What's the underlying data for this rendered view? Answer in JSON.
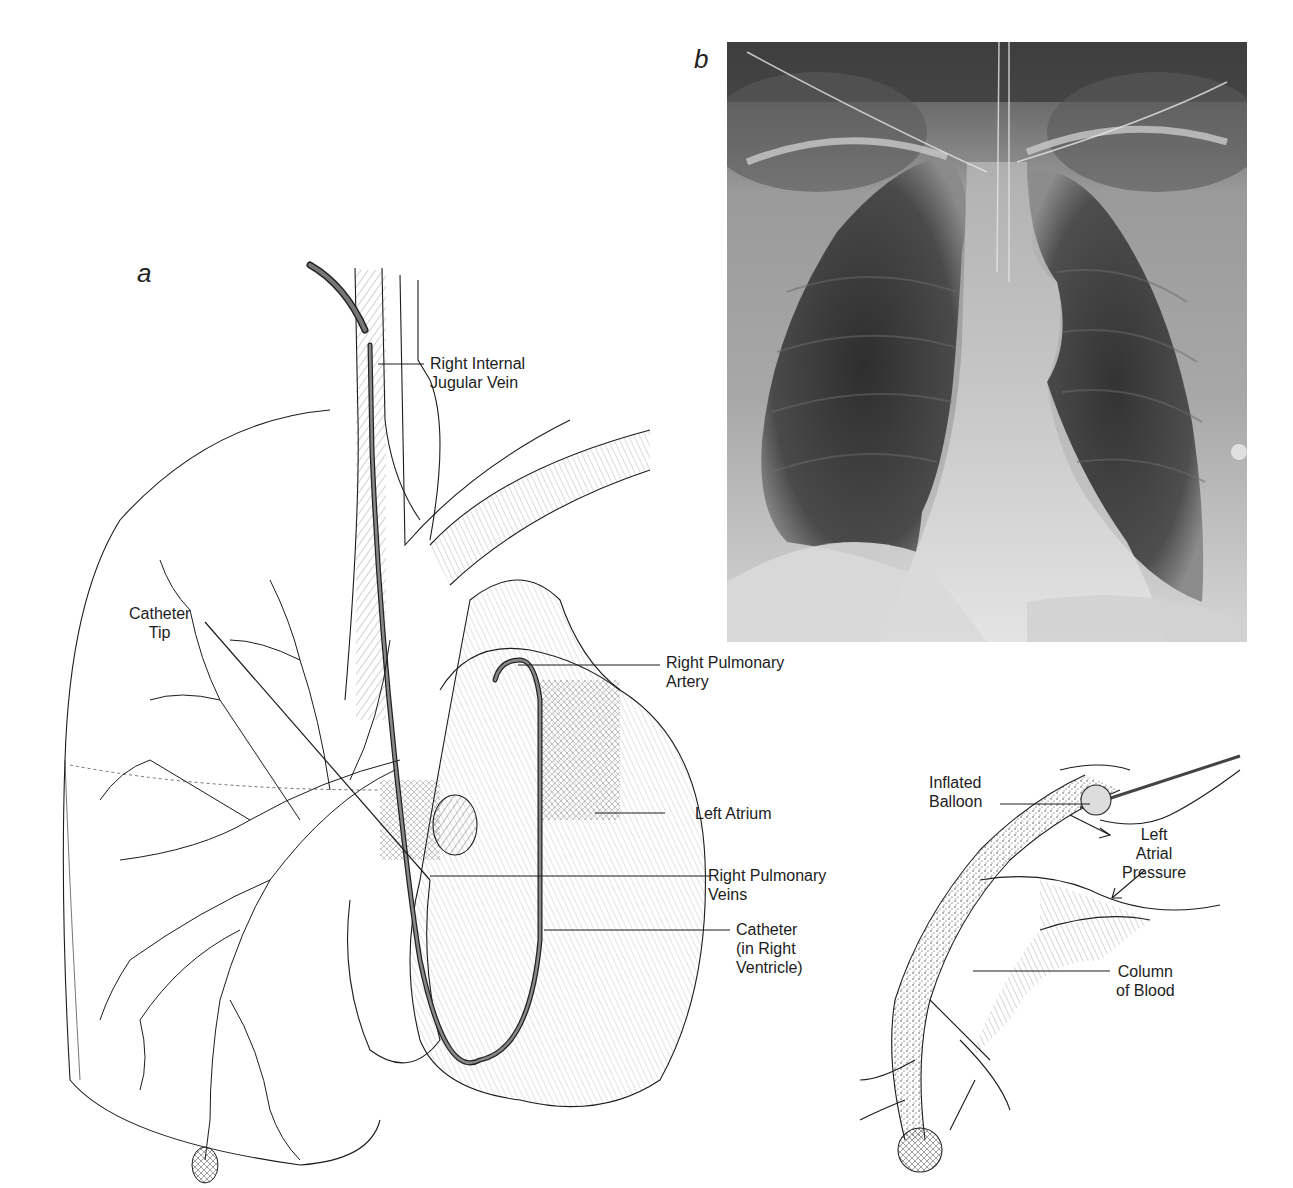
{
  "figure": {
    "panels": [
      {
        "id": "a",
        "letter": "a",
        "description": "Anatomical drawing of right heart catheterization via right internal jugular vein"
      },
      {
        "id": "b",
        "letter": "b",
        "description": "Chest x-ray"
      },
      {
        "id": "inset",
        "letter": "",
        "description": "Wedged balloon catheter in pulmonary artery branch"
      }
    ],
    "labels_a": {
      "jugular": "Right Internal\nJugular Vein",
      "catheter_tip": "Catheter\nTip",
      "rpa": "Right Pulmonary\nArtery",
      "left_atrium": "Left Atrium",
      "rpv": "Right Pulmonary\nVeins",
      "catheter_rv": "Catheter\n(in Right\nVentricle)"
    },
    "labels_inset": {
      "balloon": "Inflated\nBalloon",
      "lap": "Left\nAtrial\nPressure",
      "column": "Column\nof Blood"
    },
    "colors": {
      "ink": "#1c1c1c",
      "catheter": "#555555",
      "xray_dark": "#3a3a3a",
      "xray_light": "#d8d8d8"
    }
  }
}
